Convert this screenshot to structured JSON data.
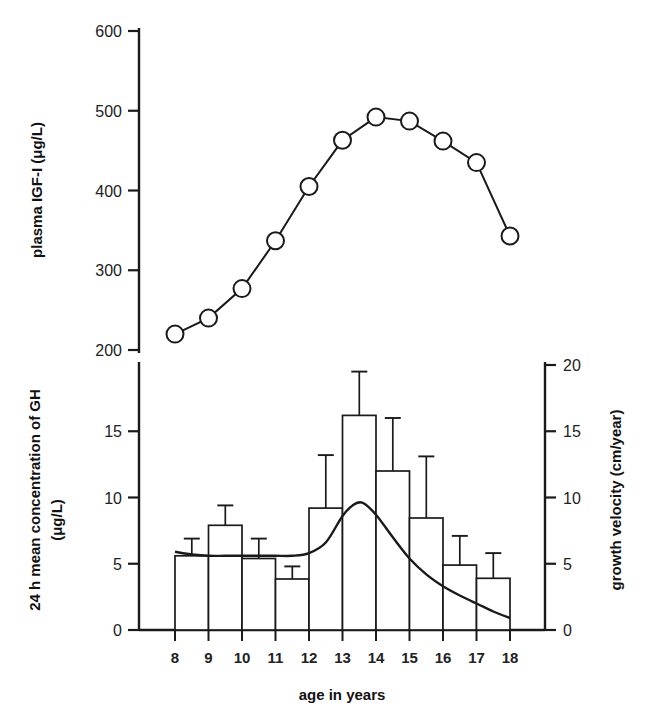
{
  "figure": {
    "xaxis_label": "age in years",
    "x_categories": [
      "8",
      "9",
      "10",
      "11",
      "12",
      "13",
      "14",
      "15",
      "16",
      "17",
      "18"
    ]
  },
  "top_panel": {
    "ylabel": "plasma IGF-I (μg/L)",
    "yticks": [
      "200",
      "300",
      "400",
      "500",
      "600"
    ]
  },
  "bottom_panel": {
    "ylabel_left_line1": "24 h mean concentration of GH",
    "ylabel_left_line2": "(μg/L)",
    "ylabel_right": "growth velocity (cm/year)",
    "yticks_left": [
      "0",
      "5",
      "10",
      "15"
    ],
    "yticks_right": [
      "0",
      "5",
      "10",
      "15",
      "20"
    ]
  },
  "chart_data": [
    {
      "type": "line",
      "title": "",
      "panel": "top",
      "xlabel": "age in years",
      "ylabel": "plasma IGF-I (μg/L)",
      "xlim": [
        7.5,
        18.5
      ],
      "ylim": [
        200,
        620
      ],
      "yticks": [
        200,
        300,
        400,
        500,
        600
      ],
      "grid": false,
      "legend": "none",
      "marker": "open-circle",
      "x": [
        8,
        9,
        10,
        11,
        12,
        13,
        14,
        15,
        16,
        17,
        18
      ],
      "values": [
        220,
        240,
        277,
        337,
        405,
        463,
        492,
        487,
        462,
        435,
        343
      ]
    },
    {
      "type": "bar",
      "title": "",
      "panel": "bottom",
      "xlabel": "age in years",
      "ylabel": "24 h mean concentration of GH (μg/L)",
      "ylim": [
        0,
        20
      ],
      "yticks": [
        0,
        5,
        10,
        15
      ],
      "grid": false,
      "legend": "none",
      "categories": [
        "8-9",
        "9-10",
        "10-11",
        "11-12",
        "12-13",
        "13-14",
        "14-15",
        "15-16",
        "16-17",
        "17-18"
      ],
      "bin_starts": [
        8,
        9,
        10,
        11,
        12,
        13,
        14,
        15,
        16,
        17
      ],
      "values": [
        5.6,
        7.9,
        5.4,
        3.85,
        9.2,
        16.2,
        12.0,
        8.45,
        4.9,
        3.9
      ],
      "errors_upper": [
        6.9,
        9.4,
        6.9,
        4.8,
        13.2,
        19.5,
        16.0,
        13.1,
        7.1,
        5.8
      ]
    },
    {
      "type": "line",
      "title": "",
      "panel": "bottom",
      "xlabel": "age in years",
      "ylabel": "growth velocity (cm/year)",
      "ylim": [
        0,
        20
      ],
      "yticks": [
        0,
        5,
        10,
        15,
        20
      ],
      "grid": false,
      "legend": "none",
      "marker": "none",
      "x": [
        8,
        8.5,
        9,
        9.5,
        10,
        10.5,
        11,
        11.5,
        12,
        12.5,
        13,
        13.3,
        13.6,
        14,
        14.5,
        15,
        15.5,
        16,
        16.5,
        17,
        17.5,
        18
      ],
      "values": [
        5.9,
        5.7,
        5.6,
        5.6,
        5.6,
        5.6,
        5.6,
        5.6,
        5.8,
        6.6,
        8.6,
        9.4,
        9.6,
        8.7,
        7.0,
        5.4,
        4.2,
        3.3,
        2.6,
        2.0,
        1.4,
        0.9
      ]
    }
  ]
}
